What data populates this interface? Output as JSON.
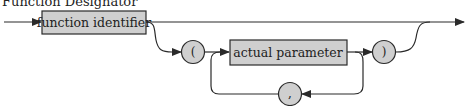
{
  "title": "Function Designator",
  "nodes": {
    "function_identifier": {
      "label": "function identifier",
      "kind": "nonterminal"
    },
    "open_paren": {
      "label": "(",
      "kind": "terminal"
    },
    "actual_parameter": {
      "label": "actual parameter",
      "kind": "nonterminal"
    },
    "close_paren": {
      "label": ")",
      "kind": "terminal"
    },
    "comma": {
      "label": ",",
      "kind": "terminal"
    }
  },
  "colors": {
    "box_fill": "#cfcfcf",
    "line": "#2a2a2a",
    "text": "#222222"
  }
}
